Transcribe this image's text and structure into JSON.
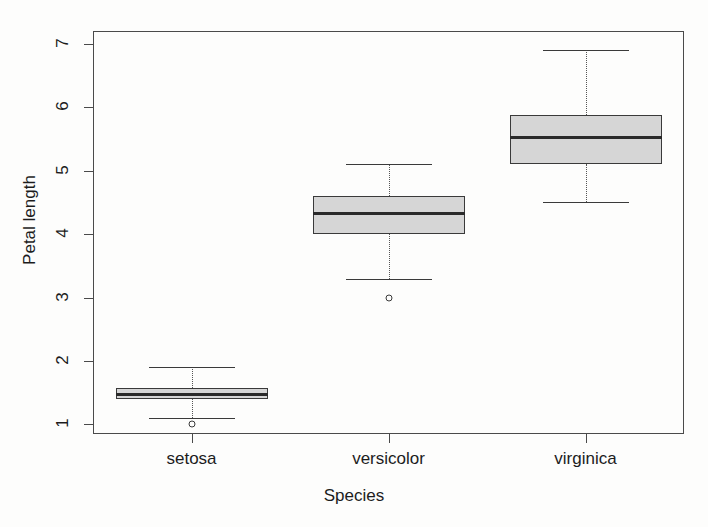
{
  "chart_data": {
    "type": "box",
    "title": "",
    "xlabel": "Species",
    "ylabel": "Petal length",
    "categories": [
      "setosa",
      "versicolor",
      "virginica"
    ],
    "ylim": [
      0.85,
      7.2
    ],
    "yticks": [
      1,
      2,
      3,
      4,
      5,
      6,
      7
    ],
    "ytick_labels": [
      "1",
      "2",
      "3",
      "4",
      "5",
      "6",
      "7"
    ],
    "grid": false,
    "legend": null,
    "box_fill_color": "#d6d6d6",
    "box_line_color": "#3a3a3a",
    "series": [
      {
        "name": "setosa",
        "min_whisker": 1.1,
        "q1": 1.4,
        "median": 1.5,
        "q3": 1.575,
        "max_whisker": 1.9,
        "outliers": [
          1.0
        ]
      },
      {
        "name": "versicolor",
        "min_whisker": 3.3,
        "q1": 4.0,
        "median": 4.35,
        "q3": 4.6,
        "max_whisker": 5.1,
        "outliers": [
          3.0
        ]
      },
      {
        "name": "virginica",
        "min_whisker": 4.5,
        "q1": 5.1,
        "median": 5.55,
        "q3": 5.875,
        "max_whisker": 6.9,
        "outliers": []
      }
    ]
  },
  "axes": {
    "y_title": "Petal length",
    "x_title": "Species",
    "y_tick_labels": [
      "1",
      "2",
      "3",
      "4",
      "5",
      "6",
      "7"
    ],
    "x_tick_labels": [
      "setosa",
      "versicolor",
      "virginica"
    ]
  }
}
